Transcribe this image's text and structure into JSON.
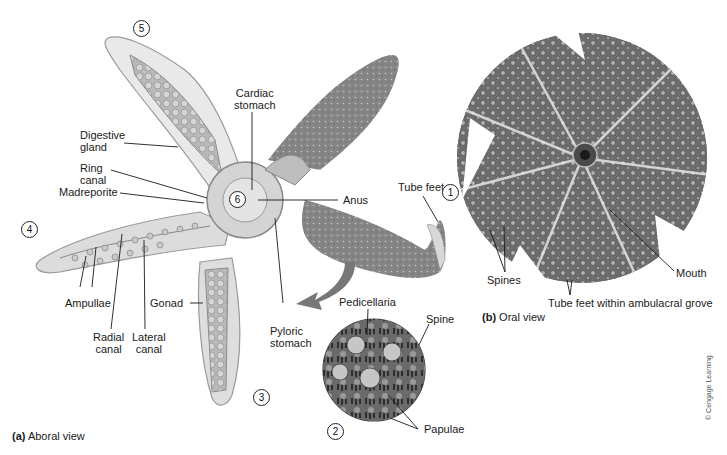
{
  "figure": {
    "panel_a": {
      "letter": "(a)",
      "title": "Aboral view",
      "labels": {
        "digestive_gland": "Digestive\ngland",
        "ring_canal": "Ring\ncanal",
        "madreporite": "Madreporite",
        "cardiac_stomach": "Cardiac\nstomach",
        "anus": "Anus",
        "tube_feet": "Tube feet",
        "ampullae": "Ampullae",
        "radial_canal": "Radial\ncanal",
        "lateral_canal": "Lateral\ncanal",
        "gonad": "Gonad",
        "pyloric_stomach": "Pyloric\nstomach",
        "pedicellaria": "Pedicellaria",
        "spine": "Spine",
        "papulae": "Papulae"
      },
      "numbers": [
        "1",
        "2",
        "3",
        "4",
        "5",
        "6"
      ]
    },
    "panel_b": {
      "letter": "(b)",
      "title": "Oral view",
      "labels": {
        "spines": "Spines",
        "mouth": "Mouth",
        "tube_feet_groove": "Tube feet within ambulacral grove"
      }
    },
    "credit": "© Cengage Learning",
    "colors": {
      "body_gray": "#8a8a8a",
      "inner_gray": "#c8c8c8",
      "rim": "#e8e8e8",
      "dark": "#3a3a3a"
    }
  }
}
